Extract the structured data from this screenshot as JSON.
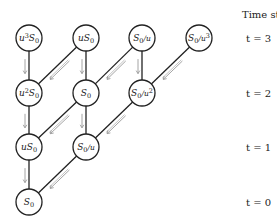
{
  "diagram": {
    "type": "binomial-tree",
    "time_header": "Time step",
    "time_labels": [
      {
        "label": "t = 3",
        "row": 0
      },
      {
        "label": "t = 2",
        "row": 1
      },
      {
        "label": "t = 1",
        "row": 2
      },
      {
        "label": "t = 0",
        "row": 3
      }
    ],
    "nodes": [
      {
        "id": "n30",
        "row": 0,
        "col": 0,
        "base": "u",
        "sup": "3",
        "main": "S",
        "sub": "0",
        "tail": "",
        "tailsup": ""
      },
      {
        "id": "n31",
        "row": 0,
        "col": 1,
        "base": "u",
        "sup": "",
        "main": "S",
        "sub": "0",
        "tail": "",
        "tailsup": ""
      },
      {
        "id": "n32",
        "row": 0,
        "col": 2,
        "base": "",
        "sup": "",
        "main": "S",
        "sub": "0",
        "tail": "/u",
        "tailsup": ""
      },
      {
        "id": "n33",
        "row": 0,
        "col": 3,
        "base": "",
        "sup": "",
        "main": "S",
        "sub": "0",
        "tail": "/u",
        "tailsup": "3"
      },
      {
        "id": "n20",
        "row": 1,
        "col": 0,
        "base": "u",
        "sup": "2",
        "main": "S",
        "sub": "0",
        "tail": "",
        "tailsup": ""
      },
      {
        "id": "n21",
        "row": 1,
        "col": 1,
        "base": "",
        "sup": "",
        "main": "S",
        "sub": "0",
        "tail": "",
        "tailsup": ""
      },
      {
        "id": "n22",
        "row": 1,
        "col": 2,
        "base": "",
        "sup": "",
        "main": "S",
        "sub": "0",
        "tail": "/u",
        "tailsup": "2"
      },
      {
        "id": "n10",
        "row": 2,
        "col": 0,
        "base": "u",
        "sup": "",
        "main": "S",
        "sub": "0",
        "tail": "",
        "tailsup": ""
      },
      {
        "id": "n11",
        "row": 2,
        "col": 1,
        "base": "",
        "sup": "",
        "main": "S",
        "sub": "0",
        "tail": "/u",
        "tailsup": ""
      },
      {
        "id": "n00",
        "row": 3,
        "col": 0,
        "base": "",
        "sup": "",
        "main": "S",
        "sub": "0",
        "tail": "",
        "tailsup": ""
      }
    ],
    "node_text": {
      "n30": "u³S₀",
      "n31": "uS₀",
      "n32": "S₀/u",
      "n33": "S₀/u³",
      "n20": "u²S₀",
      "n21": "S₀",
      "n22": "S₀/u²",
      "n10": "uS₀",
      "n11": "S₀/u",
      "n00": "S₀"
    },
    "edges": [
      {
        "from": "n30",
        "to": "n20",
        "kind": "vertical"
      },
      {
        "from": "n31",
        "to": "n21",
        "kind": "vertical"
      },
      {
        "from": "n32",
        "to": "n22",
        "kind": "vertical"
      },
      {
        "from": "n31",
        "to": "n20",
        "kind": "diagonal"
      },
      {
        "from": "n32",
        "to": "n21",
        "kind": "diagonal"
      },
      {
        "from": "n33",
        "to": "n22",
        "kind": "diagonal"
      },
      {
        "from": "n20",
        "to": "n10",
        "kind": "vertical"
      },
      {
        "from": "n21",
        "to": "n11",
        "kind": "vertical"
      },
      {
        "from": "n21",
        "to": "n10",
        "kind": "diagonal"
      },
      {
        "from": "n22",
        "to": "n11",
        "kind": "diagonal"
      },
      {
        "from": "n10",
        "to": "n00",
        "kind": "vertical"
      },
      {
        "from": "n11",
        "to": "n00",
        "kind": "diagonal"
      }
    ],
    "colors": {
      "edge": "#222222",
      "arrow": "#9a9a9a",
      "node_stroke": "#222222",
      "node_fill": "#ffffff"
    }
  }
}
